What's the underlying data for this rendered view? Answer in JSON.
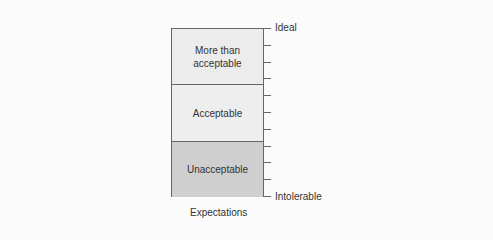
{
  "diagram": {
    "bands": [
      {
        "label": "More than acceptable",
        "line1": "More than",
        "line2": "acceptable",
        "color": "#ececec"
      },
      {
        "label": "Acceptable",
        "color": "#eeeeee"
      },
      {
        "label": "Unacceptable",
        "color": "#cfcfcf"
      }
    ],
    "scale": {
      "top_label": "Ideal",
      "bottom_label": "Intolerable",
      "tick_count": 11
    },
    "caption": "Expectations"
  }
}
